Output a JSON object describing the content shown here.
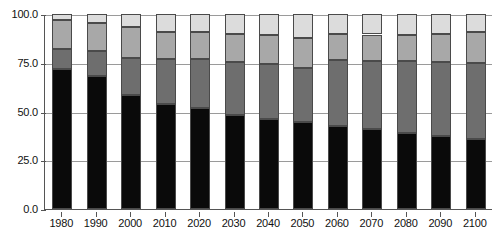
{
  "chart_data": {
    "type": "bar",
    "stacked": true,
    "title": "",
    "subtitle": "",
    "xlabel": "",
    "ylabel": "",
    "ylim": [
      0.0,
      100.0
    ],
    "ytick_labels": [
      "100.0",
      "75.0",
      "50.0",
      "25.0",
      "0.0"
    ],
    "ytick_values": [
      100.0,
      75.0,
      50.0,
      25.0,
      0.0
    ],
    "grid": true,
    "legend": "none",
    "categories": [
      "1980",
      "1990",
      "2000",
      "2010",
      "2020",
      "2030",
      "2040",
      "2050",
      "2060",
      "2070",
      "2080",
      "2090",
      "2100"
    ],
    "series": [
      {
        "name": "series-1",
        "color": "#0a0a0a",
        "values": [
          72.0,
          68.0,
          58.5,
          54.0,
          52.0,
          48.0,
          46.0,
          44.5,
          42.5,
          41.0,
          39.0,
          37.5,
          36.0
        ]
      },
      {
        "name": "series-2",
        "color": "#6e6e6e",
        "values": [
          10.0,
          13.0,
          19.0,
          23.0,
          25.0,
          27.5,
          28.5,
          28.0,
          34.0,
          35.0,
          37.0,
          38.0,
          39.0
        ]
      },
      {
        "name": "series-3",
        "color": "#a8a8a8",
        "values": [
          15.0,
          14.5,
          16.0,
          14.0,
          14.0,
          14.5,
          14.5,
          15.0,
          13.5,
          13.5,
          13.0,
          14.0,
          16.0
        ]
      },
      {
        "name": "series-4",
        "color": "#dcdcdc",
        "values": [
          3.0,
          4.5,
          6.5,
          9.0,
          9.0,
          10.0,
          11.0,
          12.5,
          10.0,
          10.5,
          11.0,
          10.5,
          9.0
        ]
      }
    ]
  },
  "axes": {
    "y_axis_name": "percentage-axis",
    "x_axis_name": "year-axis"
  }
}
